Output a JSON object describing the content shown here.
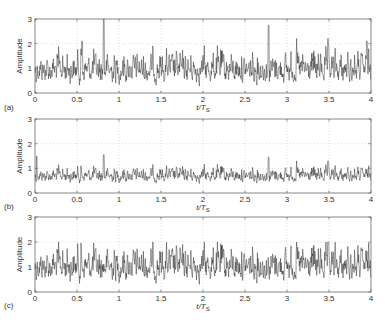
{
  "chart_data": [
    {
      "type": "line",
      "panel_label": "(a)",
      "title": "",
      "xlabel": "t/T_S",
      "ylabel": "Amplitude",
      "xlim": [
        0,
        4
      ],
      "ylim": [
        0,
        3
      ],
      "xticks": [
        "0",
        "0.5",
        "1",
        "1.5",
        "2",
        "2.5",
        "3",
        "3.5",
        "4"
      ],
      "yticks": [
        "0",
        "1",
        "2",
        "3"
      ],
      "grid": true,
      "description": "Noise-like amplitude envelope, mean ~0.9, peaks up to ~2.2, max spike ~3.0 at t~0.82 and ~2.75 at t~2.78",
      "mean": 0.9,
      "max": 3.0,
      "min": 0.05,
      "peaks": [
        {
          "x": 0.82,
          "y": 3.0
        },
        {
          "x": 2.78,
          "y": 2.75
        },
        {
          "x": 0.56,
          "y": 2.1
        },
        {
          "x": 3.95,
          "y": 2.1
        }
      ]
    },
    {
      "type": "line",
      "panel_label": "(b)",
      "title": "",
      "xlabel": "t/T_S",
      "ylabel": "Amplitude",
      "xlim": [
        0,
        4
      ],
      "ylim": [
        0,
        3
      ],
      "xticks": [
        "0",
        "0.5",
        "1",
        "1.5",
        "2",
        "2.5",
        "3",
        "3.5",
        "4"
      ],
      "yticks": [
        "0",
        "1",
        "2",
        "3"
      ],
      "grid": true,
      "description": "Compressed amplitude envelope, mean ~0.7, peaks ~1.5",
      "mean": 0.7,
      "max": 1.55,
      "min": 0.05,
      "peaks": [
        {
          "x": 0.82,
          "y": 1.55
        },
        {
          "x": 2.78,
          "y": 1.45
        },
        {
          "x": 0.02,
          "y": 1.5
        }
      ]
    },
    {
      "type": "line",
      "panel_label": "(c)",
      "title": "",
      "xlabel": "t/T_S",
      "ylabel": "Amplitude",
      "xlim": [
        0,
        4
      ],
      "ylim": [
        0,
        3
      ],
      "xticks": [
        "0",
        "0.5",
        "1",
        "1.5",
        "2",
        "2.5",
        "3",
        "3.5",
        "4"
      ],
      "yticks": [
        "0",
        "1",
        "2",
        "3"
      ],
      "grid": true,
      "description": "Clipped amplitude envelope, mean ~0.95, clipped at 2.0",
      "mean": 0.95,
      "max": 2.0,
      "min": 0.05,
      "clip_level": 2.0
    }
  ],
  "labels": {
    "ylabel": "Amplitude",
    "xlabel_main": "t/T",
    "xlabel_sub": "S",
    "panels": [
      "(a)",
      "(b)",
      "(c)"
    ],
    "xticks": [
      "0",
      "0.5",
      "1",
      "1.5",
      "2",
      "2.5",
      "3",
      "3.5",
      "4"
    ],
    "yticks": [
      "0",
      "1",
      "2",
      "3"
    ]
  }
}
